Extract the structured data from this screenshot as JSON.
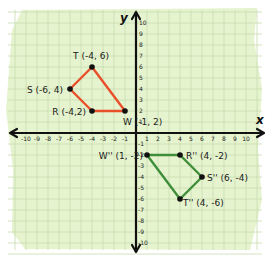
{
  "diagram": {
    "type": "coordinate-plane",
    "paper_color": "#e6f3cf",
    "grid_color": "#c6dcae",
    "axis_color": "#111111",
    "axes": {
      "x_label": "x",
      "y_label": "y",
      "x_range": [
        -10,
        10
      ],
      "y_range": [
        -10,
        10
      ],
      "x_ticks_neg": [
        "-10",
        "-9",
        "-8",
        "-7",
        "-6",
        "-5",
        "-4",
        "-3",
        "-2",
        "-1"
      ],
      "x_ticks_pos": [
        "1",
        "2",
        "3",
        "4",
        "5",
        "6",
        "7",
        "8",
        "9",
        "10"
      ],
      "y_ticks_pos": [
        "1",
        "2",
        "3",
        "4",
        "5",
        "6",
        "7",
        "8",
        "9",
        "10"
      ],
      "y_ticks_neg": [
        "-1",
        "-2",
        "-3",
        "-4",
        "-5",
        "-6",
        "-7",
        "-8",
        "-9",
        "-10"
      ]
    },
    "shapes": [
      {
        "name": "TSRW",
        "color": "#e8502a",
        "vertices": [
          {
            "name": "T",
            "x": -4,
            "y": 6,
            "label": "T (-4, 6)"
          },
          {
            "name": "S",
            "x": -6,
            "y": 4,
            "label": "S (-6, 4)"
          },
          {
            "name": "R",
            "x": -4,
            "y": 2,
            "label": "R (-4,2)"
          },
          {
            "name": "W",
            "x": -1,
            "y": 2,
            "label": "W (-1, 2)"
          }
        ]
      },
      {
        "name": "T''S''R''W''",
        "color": "#3f8f3a",
        "vertices": [
          {
            "name": "W''",
            "x": 1,
            "y": -2,
            "label": "W'' (1, -2)"
          },
          {
            "name": "R''",
            "x": 4,
            "y": -2,
            "label": "R'' (4, -2)"
          },
          {
            "name": "S''",
            "x": 6,
            "y": -4,
            "label": "S'' (6, -4)"
          },
          {
            "name": "T''",
            "x": 4,
            "y": -6,
            "label": "T'' (4, -6)"
          }
        ]
      }
    ]
  }
}
